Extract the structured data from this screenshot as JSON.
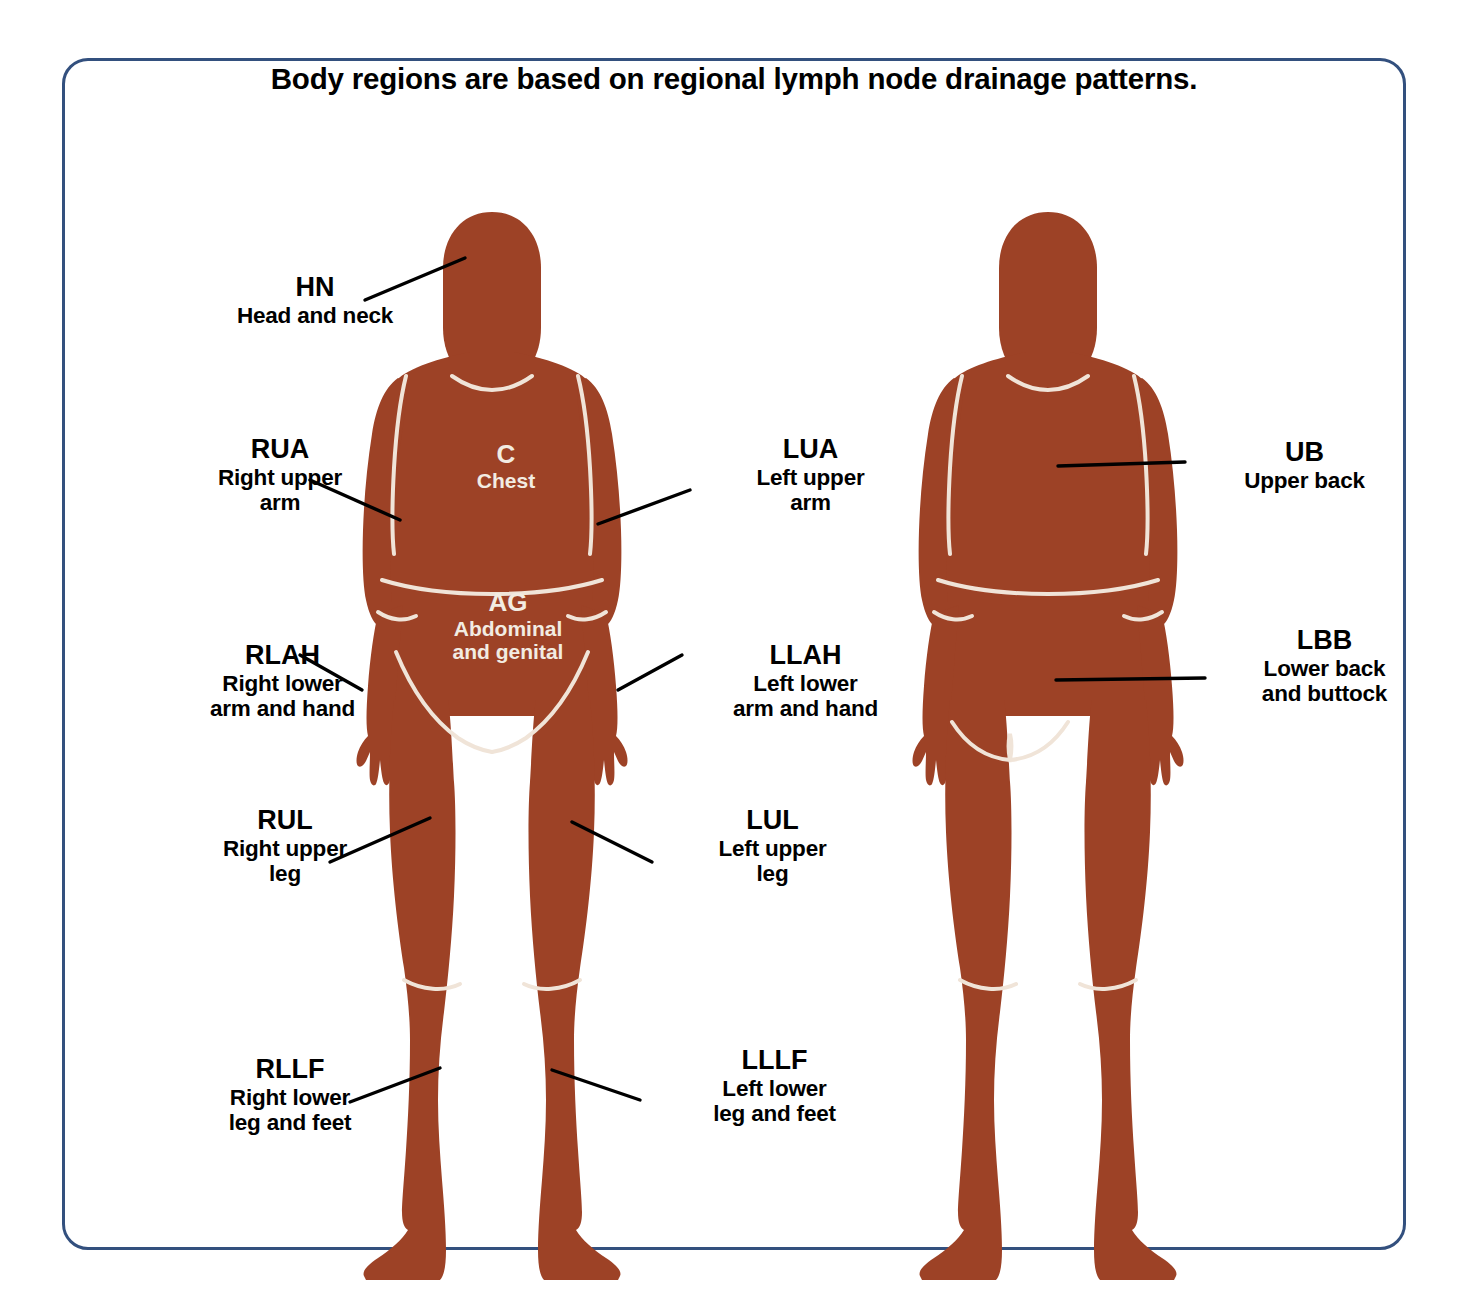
{
  "title": "Body regions are based on regional lymph node drainage patterns.",
  "colors": {
    "frame_border": "#33507e",
    "body_fill": "#9d4226",
    "region_divider": "#f0e4d8",
    "leader_line": "#000000",
    "label_text": "#000000",
    "onbody_text": "#f2ece2",
    "background": "#ffffff"
  },
  "figures": [
    {
      "name": "anterior-figure",
      "view": "front"
    },
    {
      "name": "posterior-figure",
      "view": "back"
    }
  ],
  "regions": {
    "hn": {
      "code": "HN",
      "desc_line1": "Head and neck",
      "desc_line2": ""
    },
    "rua": {
      "code": "RUA",
      "desc_line1": "Right upper",
      "desc_line2": "arm"
    },
    "rlah": {
      "code": "RLAH",
      "desc_line1": "Right lower",
      "desc_line2": "arm and hand"
    },
    "rul": {
      "code": "RUL",
      "desc_line1": "Right upper",
      "desc_line2": "leg"
    },
    "rllf": {
      "code": "RLLF",
      "desc_line1": "Right lower",
      "desc_line2": "leg and feet"
    },
    "lua": {
      "code": "LUA",
      "desc_line1": "Left upper",
      "desc_line2": "arm"
    },
    "llah": {
      "code": "LLAH",
      "desc_line1": "Left lower",
      "desc_line2": "arm and hand"
    },
    "lul": {
      "code": "LUL",
      "desc_line1": "Left upper",
      "desc_line2": "leg"
    },
    "lllf": {
      "code": "LLLF",
      "desc_line1": "Left lower",
      "desc_line2": "leg and feet"
    },
    "c": {
      "code": "C",
      "desc_line1": "Chest",
      "desc_line2": ""
    },
    "ag": {
      "code": "AG",
      "desc_line1": "Abdominal",
      "desc_line2": "and genital"
    },
    "ub": {
      "code": "UB",
      "desc_line1": "Upper back",
      "desc_line2": ""
    },
    "lbb": {
      "code": "LBB",
      "desc_line1": "Lower back",
      "desc_line2": "and buttock"
    }
  }
}
